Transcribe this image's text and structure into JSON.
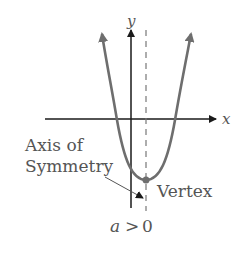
{
  "diagram": {
    "type": "parabola",
    "axis_labels": {
      "x": "x",
      "y": "y"
    },
    "annotations": {
      "axis_of_symmetry_line1": "Axis of",
      "axis_of_symmetry_line2": "Symmetry",
      "vertex": "Vertex"
    },
    "condition": {
      "variable": "a",
      "operator": ">",
      "value": "0"
    },
    "colors": {
      "curve": "#6e6e6e",
      "axes": "#1a1a1a",
      "symmetry_line": "#777777",
      "text": "#555555"
    }
  }
}
